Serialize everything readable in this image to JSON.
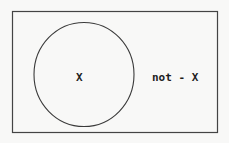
{
  "diagram": {
    "type": "venn",
    "universe": {
      "label": "not - X",
      "stroke_color": "#444444"
    },
    "set": {
      "label": "X",
      "stroke_color": "#3a3a3a"
    },
    "text_color": "#1e1e1e",
    "background": "#f8f8f7"
  }
}
